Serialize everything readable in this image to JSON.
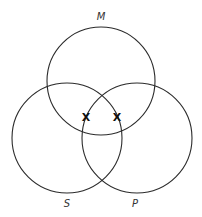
{
  "diagram": {
    "type": "venn",
    "sets": [
      {
        "label": "M",
        "cx": 101,
        "cy": 81,
        "r": 54,
        "label_x": 101,
        "label_y": 20
      },
      {
        "label": "S",
        "cx": 67,
        "cy": 138,
        "r": 55,
        "label_x": 67,
        "label_y": 207
      },
      {
        "label": "P",
        "cx": 137,
        "cy": 138,
        "r": 55,
        "label_x": 135,
        "label_y": 207
      }
    ],
    "marks": [
      {
        "symbol": "X",
        "x": 86,
        "y": 121,
        "region": "M ∩ S (outside P)"
      },
      {
        "symbol": "X",
        "x": 117,
        "y": 121,
        "region": "M ∩ P (outside S)"
      }
    ],
    "stroke_color": "#2b2b2b",
    "background": "#ffffff"
  }
}
